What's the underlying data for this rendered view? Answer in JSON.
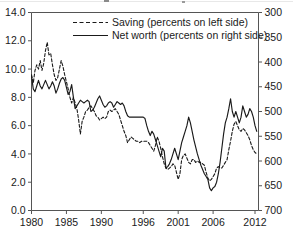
{
  "chart_data": {
    "type": "line",
    "title": "",
    "xlabel": "",
    "ylabel": "",
    "grid": false,
    "legend_position": "top-center",
    "x_ticks": [
      1980,
      1985,
      1990,
      1996,
      2001,
      2006,
      2012
    ],
    "x_tick_labels": [
      "1980",
      "1985",
      "1990",
      "1996",
      "2001",
      "2006",
      "2012"
    ],
    "xlim": [
      1980,
      2012.5
    ],
    "left_axis": {
      "label": "Saving (percents on left side)",
      "ticks": [
        0.0,
        2.0,
        4.0,
        6.0,
        8.0,
        10.0,
        12.0,
        14.0
      ],
      "tick_labels": [
        "0.0",
        "2.0",
        "4.0",
        "6.0",
        "8.0",
        "10.0",
        "12.0",
        "14.0"
      ],
      "ylim": [
        0.0,
        14.0
      ],
      "inverted": false
    },
    "right_axis": {
      "label": "Net worth (percents on right side)",
      "ticks": [
        300,
        350,
        400,
        450,
        500,
        550,
        600,
        650,
        700
      ],
      "tick_labels": [
        "300",
        "350",
        "400",
        "450",
        "500",
        "550",
        "600",
        "650",
        "700"
      ],
      "ylim": [
        300,
        700
      ],
      "inverted": true
    },
    "series": [
      {
        "name": "Saving (percents on left side)",
        "axis": "left",
        "style": "dashed",
        "color": "#1a1a1a",
        "x": [
          1980.0,
          1980.25,
          1980.5,
          1980.75,
          1981.0,
          1981.25,
          1981.5,
          1981.75,
          1982.0,
          1982.25,
          1982.5,
          1982.75,
          1983.0,
          1983.25,
          1983.5,
          1983.75,
          1984.0,
          1984.25,
          1984.5,
          1984.75,
          1985.0,
          1985.25,
          1985.5,
          1985.75,
          1986.0,
          1986.25,
          1986.5,
          1986.75,
          1987.0,
          1987.25,
          1987.5,
          1987.75,
          1988.0,
          1988.25,
          1988.5,
          1988.75,
          1989.0,
          1989.25,
          1989.5,
          1989.75,
          1990.0,
          1990.25,
          1990.5,
          1990.75,
          1991.0,
          1991.25,
          1991.5,
          1991.75,
          1992.0,
          1992.25,
          1992.5,
          1992.75,
          1993.0,
          1993.25,
          1993.5,
          1993.75,
          1994.0,
          1994.25,
          1994.5,
          1994.75,
          1995.0,
          1995.25,
          1995.5,
          1995.75,
          1996.0,
          1996.25,
          1996.5,
          1996.75,
          1997.0,
          1997.25,
          1997.5,
          1997.75,
          1998.0,
          1998.25,
          1998.5,
          1998.75,
          1999.0,
          1999.25,
          1999.5,
          1999.75,
          2000.0,
          2000.25,
          2000.5,
          2000.75,
          2001.0,
          2001.25,
          2001.5,
          2001.75,
          2002.0,
          2002.25,
          2002.5,
          2002.75,
          2003.0,
          2003.25,
          2003.5,
          2003.75,
          2004.0,
          2004.25,
          2004.5,
          2004.75,
          2005.0,
          2005.25,
          2005.5,
          2005.75,
          2006.0,
          2006.25,
          2006.5,
          2006.75,
          2007.0,
          2007.25,
          2007.5,
          2007.75,
          2008.0,
          2008.25,
          2008.5,
          2008.75,
          2009.0,
          2009.25,
          2009.5,
          2009.75,
          2010.0,
          2010.25,
          2010.5,
          2010.75,
          2011.0,
          2011.25,
          2011.5,
          2011.75,
          2012.0,
          2012.25
        ],
        "y": [
          9.6,
          9.0,
          9.9,
          10.3,
          10.0,
          10.6,
          9.9,
          10.4,
          11.3,
          11.9,
          11.0,
          11.1,
          10.3,
          9.6,
          9.2,
          9.4,
          10.0,
          10.6,
          10.2,
          9.6,
          9.1,
          8.6,
          8.0,
          7.6,
          8.0,
          7.6,
          7.2,
          6.4,
          5.4,
          6.3,
          6.6,
          7.0,
          7.1,
          7.3,
          7.4,
          7.2,
          7.0,
          6.7,
          6.6,
          6.4,
          6.5,
          6.6,
          6.5,
          6.6,
          7.0,
          7.1,
          7.0,
          7.1,
          7.2,
          7.0,
          6.8,
          6.4,
          6.0,
          5.6,
          5.3,
          4.8,
          5.0,
          5.2,
          5.1,
          5.0,
          4.9,
          4.9,
          4.8,
          4.9,
          4.9,
          4.9,
          4.9,
          4.8,
          4.6,
          4.4,
          4.2,
          4.6,
          5.2,
          4.9,
          4.4,
          3.8,
          3.3,
          3.0,
          2.9,
          3.0,
          3.1,
          3.3,
          3.2,
          2.7,
          2.2,
          2.6,
          3.6,
          3.9,
          4.0,
          3.7,
          3.4,
          3.3,
          3.6,
          3.6,
          3.4,
          3.5,
          3.4,
          3.4,
          3.3,
          3.2,
          2.7,
          2.3,
          2.1,
          2.2,
          2.4,
          2.6,
          3.0,
          3.1,
          3.0,
          3.0,
          3.2,
          3.4,
          3.6,
          4.3,
          4.9,
          5.6,
          6.1,
          6.3,
          6.0,
          5.7,
          5.6,
          5.8,
          5.7,
          5.5,
          5.3,
          5.0,
          4.6,
          4.3,
          4.1,
          4.0
        ]
      },
      {
        "name": "Net worth (percents on right side)",
        "axis": "right",
        "style": "solid",
        "color": "#1a1a1a",
        "x": [
          1980.0,
          1980.25,
          1980.5,
          1980.75,
          1981.0,
          1981.25,
          1981.5,
          1981.75,
          1982.0,
          1982.25,
          1982.5,
          1982.75,
          1983.0,
          1983.25,
          1983.5,
          1983.75,
          1984.0,
          1984.25,
          1984.5,
          1984.75,
          1985.0,
          1985.25,
          1985.5,
          1985.75,
          1986.0,
          1986.25,
          1986.5,
          1986.75,
          1987.0,
          1987.25,
          1987.5,
          1987.75,
          1988.0,
          1988.25,
          1988.5,
          1988.75,
          1989.0,
          1989.25,
          1989.5,
          1989.75,
          1990.0,
          1990.25,
          1990.5,
          1990.75,
          1991.0,
          1991.25,
          1991.5,
          1991.75,
          1992.0,
          1992.25,
          1992.5,
          1992.75,
          1993.0,
          1993.25,
          1993.5,
          1993.75,
          1994.0,
          1994.25,
          1994.5,
          1994.75,
          1995.0,
          1995.25,
          1995.5,
          1995.75,
          1996.0,
          1996.25,
          1996.5,
          1996.75,
          1997.0,
          1997.25,
          1997.5,
          1997.75,
          1998.0,
          1998.25,
          1998.5,
          1998.75,
          1999.0,
          1999.25,
          1999.5,
          1999.75,
          2000.0,
          2000.25,
          2000.5,
          2000.75,
          2001.0,
          2001.25,
          2001.5,
          2001.75,
          2002.0,
          2002.25,
          2002.5,
          2002.75,
          2003.0,
          2003.25,
          2003.5,
          2003.75,
          2004.0,
          2004.25,
          2004.5,
          2004.75,
          2005.0,
          2005.25,
          2005.5,
          2005.75,
          2006.0,
          2006.25,
          2006.5,
          2006.75,
          2007.0,
          2007.25,
          2007.5,
          2007.75,
          2008.0,
          2008.25,
          2008.5,
          2008.75,
          2009.0,
          2009.25,
          2009.5,
          2009.75,
          2010.0,
          2010.25,
          2010.5,
          2010.75,
          2011.0,
          2011.25,
          2011.5,
          2011.75,
          2012.0,
          2012.25
        ],
        "y_left_equiv": [
          9.5,
          8.6,
          8.4,
          8.8,
          9.2,
          8.8,
          8.6,
          8.9,
          9.2,
          8.9,
          8.6,
          8.8,
          9.1,
          8.8,
          8.3,
          8.6,
          9.0,
          9.3,
          9.4,
          9.2,
          8.7,
          8.2,
          8.4,
          8.9,
          8.0,
          7.2,
          7.4,
          7.6,
          7.8,
          7.7,
          7.6,
          7.7,
          7.8,
          7.7,
          7.0,
          7.1,
          7.3,
          7.6,
          7.9,
          8.1,
          7.8,
          7.5,
          7.3,
          7.4,
          7.6,
          7.7,
          7.6,
          7.3,
          7.5,
          7.7,
          7.6,
          7.5,
          7.6,
          7.4,
          7.0,
          6.7,
          6.6,
          6.6,
          6.6,
          6.6,
          6.6,
          6.6,
          6.6,
          6.6,
          6.6,
          6.5,
          6.0,
          5.6,
          5.3,
          5.6,
          5.4,
          5.0,
          4.6,
          4.2,
          3.8,
          4.4,
          4.2,
          3.0,
          3.1,
          3.3,
          3.6,
          4.0,
          4.4,
          4.0,
          3.6,
          4.2,
          4.8,
          5.2,
          5.6,
          6.0,
          6.6,
          6.2,
          5.6,
          5.0,
          4.5,
          4.0,
          3.6,
          3.2,
          2.9,
          2.6,
          2.4,
          2.2,
          1.6,
          1.4,
          1.6,
          1.7,
          2.0,
          2.6,
          3.4,
          4.4,
          5.4,
          6.2,
          6.6,
          7.2,
          7.9,
          7.0,
          6.6,
          7.0,
          6.6,
          6.2,
          6.6,
          7.4,
          7.0,
          6.6,
          6.8,
          7.2,
          7.0,
          6.6,
          6.0,
          5.6
        ]
      }
    ],
    "legend": [
      {
        "label": "Saving (percents on left side)",
        "style": "dashed"
      },
      {
        "label": "Net worth (percents on right side)",
        "style": "solid"
      }
    ]
  }
}
